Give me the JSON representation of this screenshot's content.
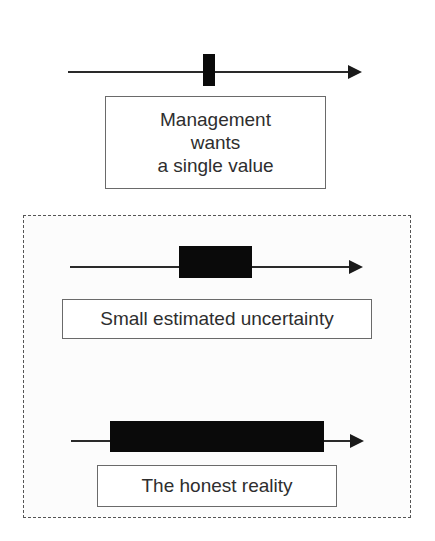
{
  "panels": {
    "top": {
      "label_lines": [
        "Management",
        "wants",
        "a single value"
      ]
    },
    "middle": {
      "label": "Small estimated uncertainty"
    },
    "bottom": {
      "label": "The honest reality"
    }
  },
  "colors": {
    "bar": "#0a0a0a",
    "axis": "#2a2a2a",
    "box_border": "#6a6a6a",
    "dashed_border": "#555555",
    "text": "#2e2e2e"
  }
}
